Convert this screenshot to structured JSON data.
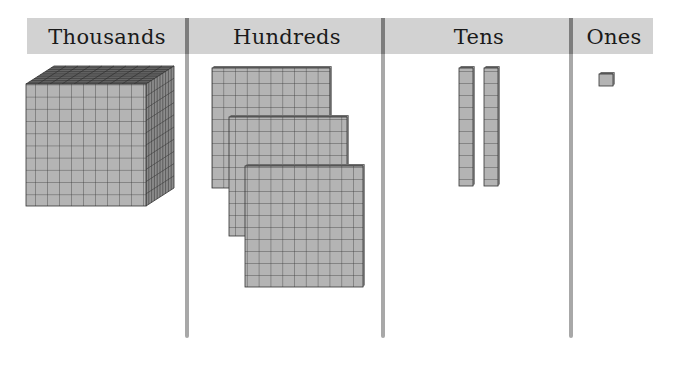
{
  "chart": {
    "columns": [
      {
        "label": "Thousands",
        "block": "cube",
        "count": 1
      },
      {
        "label": "Hundreds",
        "block": "flat",
        "count": 3
      },
      {
        "label": "Tens",
        "block": "rod",
        "count": 2
      },
      {
        "label": "Ones",
        "block": "unit",
        "count": 1
      }
    ],
    "represented_value": 1321
  },
  "colors": {
    "header_bg": "#d2d2d2",
    "divider": "#a8a8a8",
    "block_face": "#b4b4b4",
    "block_grid": "#3c3c3c",
    "block_side": "#8c8c8c",
    "block_top": "#6e6e6e"
  }
}
